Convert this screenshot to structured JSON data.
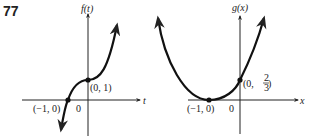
{
  "problem_number": "77",
  "graphs": [
    {
      "id": "f",
      "y_label": "f(t)",
      "x_label": "t",
      "origin_label": "0",
      "curve": "cubic-like, increasing, inflection at (0, 1)",
      "points": [
        {
          "label": "(−1, 0)",
          "x": -1,
          "y": 0
        },
        {
          "label": "(0, 1)",
          "x": 0,
          "y": 1
        }
      ]
    },
    {
      "id": "g",
      "y_label": "g(x)",
      "x_label": "x",
      "origin_label": "0",
      "curve": "parabola opening upward, vertex at (−1, 0)",
      "points": [
        {
          "label": "(−1, 0)",
          "x": -1,
          "y": 0
        },
        {
          "label_prefix": "(0, ",
          "frac_num": "2",
          "frac_den": "3",
          "label_suffix": " )",
          "x": 0,
          "y": 0.6667
        }
      ]
    }
  ]
}
